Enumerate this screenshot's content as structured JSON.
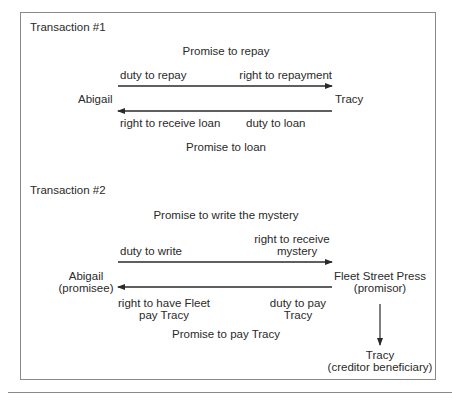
{
  "transaction1": {
    "title": "Transaction #1",
    "top_promise": "Promise to repay",
    "left_party": "Abigail",
    "right_party": "Tracy",
    "arrow_right": {
      "left_label": "duty to repay",
      "right_label": "right to repayment"
    },
    "arrow_left": {
      "left_label": "right to receive loan",
      "right_label": "duty to loan"
    },
    "bottom_promise": "Promise to loan"
  },
  "transaction2": {
    "title": "Transaction #2",
    "top_promise": "Promise to write the mystery",
    "left_party": {
      "name": "Abigail",
      "role": "(promisee)"
    },
    "right_party": {
      "name": "Fleet Street Press",
      "role": "(promisor)"
    },
    "arrow_right": {
      "left_label": "duty to write",
      "right_label_line1": "right to receive",
      "right_label_line2": "mystery"
    },
    "arrow_left": {
      "left_label_line1": "right to have Fleet",
      "left_label_line2": "pay Tracy",
      "right_label_line1": "duty to pay",
      "right_label_line2": "Tracy"
    },
    "bottom_promise": "Promise to pay Tracy",
    "beneficiary": {
      "name": "Tracy",
      "role": "(creditor beneficiary)"
    }
  },
  "colors": {
    "line": "#2a2a2a",
    "frame": "#8a8a8a",
    "text": "#2a2a2a"
  }
}
